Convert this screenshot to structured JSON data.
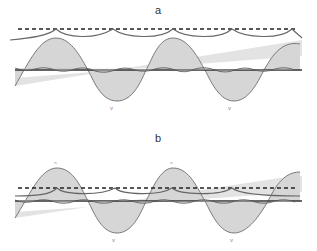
{
  "panels": [
    {
      "id": "a",
      "label": "a"
    },
    {
      "id": "b",
      "label": "b"
    }
  ],
  "colors": {
    "fill": "#d6d6d6",
    "sine_stroke": "#7a7a7a",
    "envelope": "#6a6a6a",
    "dashed": "#222222",
    "midline": "#333333"
  }
}
